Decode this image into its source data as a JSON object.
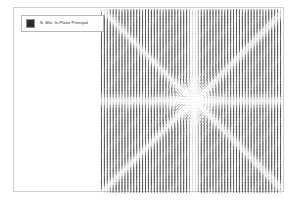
{
  "window": {
    "background_color": "#ffffff",
    "frame_color": "#cfcfcf"
  },
  "legend": {
    "label": "S, Min. In-Plane Principal",
    "swatch_color": "#2b2b2b",
    "border_color": "#b9b9b9",
    "icon": "legend-color-swatch"
  },
  "chart_data": {
    "type": "scatter",
    "title": "S, Min. In-Plane Principal",
    "subtype": "principal-stress-symbol-plot",
    "xlabel": "",
    "ylabel": "",
    "grid": false,
    "legend_position": "top-left",
    "legend_entries": [
      "S, Min. In-Plane Principal"
    ],
    "symbol_color": "#2b2b2b",
    "plot_region_px": {
      "x": 99,
      "y": 8,
      "width": 182,
      "height": 184
    },
    "singularity_center_px": {
      "x": 193,
      "y": 100
    },
    "grid_columns": 62,
    "grid_rows": 62,
    "xlim": [
      -1,
      1
    ],
    "ylim": [
      -1,
      1
    ],
    "annotations": [
      "Radial tensor symbol field with central stress concentration",
      "Four light diagonal rays emanating from center",
      "Light horizontal and vertical bands through center"
    ]
  }
}
